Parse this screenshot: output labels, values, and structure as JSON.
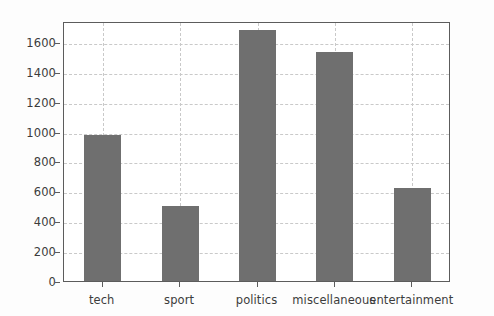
{
  "chart_data": {
    "type": "bar",
    "title": "",
    "xlabel": "",
    "ylabel": "",
    "categories": [
      "tech",
      "sport",
      "politics",
      "miscellaneous",
      "entertainment"
    ],
    "values": [
      975,
      500,
      1680,
      1530,
      620
    ],
    "ylim": [
      0,
      1740
    ],
    "yticks": [
      0,
      200,
      400,
      600,
      800,
      1000,
      1200,
      1400,
      1600
    ],
    "ytick_labels": [
      "0",
      "200",
      "400",
      "600",
      "800",
      "1000",
      "1200",
      "1400",
      "1600"
    ],
    "grid": true,
    "grid_axis": "both",
    "legend": null,
    "bar_color": "#6f6f6f",
    "grid_color": "#c9c9c9",
    "axis_color": "#5c5c5c",
    "background_color": "#ffffff"
  }
}
